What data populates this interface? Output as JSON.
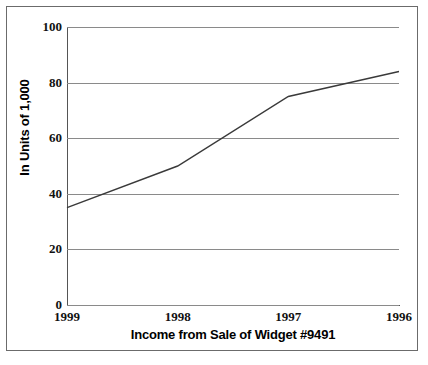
{
  "chart_data": {
    "type": "line",
    "title": "",
    "subtitle": "",
    "xlabel": "Income from Sale of Widget #9491",
    "ylabel": "In Units of 1,000",
    "categories": [
      "1999",
      "1998",
      "1997",
      "1996"
    ],
    "x_tick_labels": [
      "1999",
      "1998",
      "1997",
      "1996"
    ],
    "y_tick_labels": [
      "0",
      "20",
      "40",
      "60",
      "80",
      "100"
    ],
    "y_ticks": [
      0,
      20,
      40,
      60,
      80,
      100
    ],
    "xlim": [
      0,
      3
    ],
    "ylim": [
      0,
      100
    ],
    "grid": "horizontal",
    "legend": "none",
    "series": [
      {
        "name": "Income",
        "values": [
          35,
          50,
          75,
          84
        ]
      }
    ],
    "line_color": "#3a3a3a",
    "grid_color": "#8a8a8a",
    "axis_color": "#555555",
    "background_color": "#ffffff",
    "frame_color": "#6b6b6b"
  }
}
